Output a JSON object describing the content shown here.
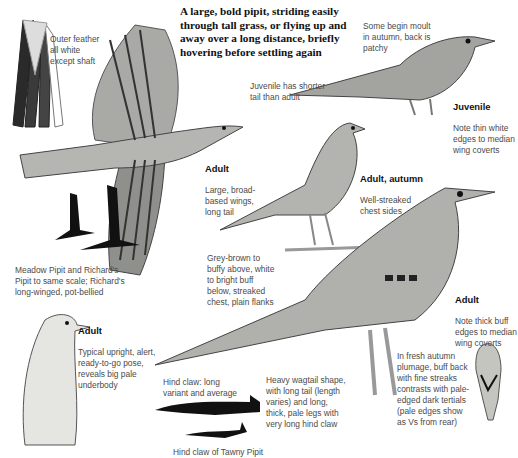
{
  "intro": {
    "text": "A large, bold pipit, striding easily through tall grass, or flying up and away over a long distance, briefly hovering before settling again"
  },
  "annotations": {
    "outer_feather": {
      "title": "",
      "text": "Outer feather\nall white\nexcept shaft"
    },
    "moult": {
      "title": "",
      "text": "Some begin moult\nin autumn, back is\npatchy"
    },
    "juvenile_tail": {
      "title": "",
      "text": "Juvenile has shorter\ntail than adult"
    },
    "juvenile": {
      "title": "Juvenile",
      "text": "Note thin white\nedges to median\nwing coverts"
    },
    "adult_flight": {
      "title": "Adult",
      "text": "Large, broad-\nbased wings,\nlong tail"
    },
    "adult_autumn": {
      "title": "Adult, autumn",
      "text": "Well-streaked\nchest sides"
    },
    "silhouettes": {
      "title": "",
      "text": "Meadow Pipit and Richard's\nPipit to same scale; Richard's\nlong-winged, pot-bellied"
    },
    "plumage": {
      "title": "",
      "text": "Grey-brown to\nbuffy above, white\nto bright buff\nbelow, streaked\nchest, plain flanks"
    },
    "adult_large": {
      "title": "Adult",
      "text": "Note thick buff\nedges to median\nwing coverts"
    },
    "adult_upright": {
      "title": "Adult",
      "text": "Typical upright, alert,\nready-to-go pose,\nreveals big pale\nunderbody"
    },
    "hind_claw": {
      "title": "",
      "text": "Hind claw: long\nvariant and average"
    },
    "shape": {
      "title": "",
      "text": "Heavy wagtail shape,\nwith long tail (length\nvaries) and long,\nthick, pale legs with\nvery long hind claw"
    },
    "autumn_back": {
      "title": "",
      "text": "In fresh autumn\nplumage, buff back\nwith fine streaks\ncontrasts with pale-\nedged dark tertials\n(pale edges show\nas Vs from rear)"
    },
    "tawny_claw": {
      "title": "",
      "text": "Hind claw of Tawny Pipit"
    }
  },
  "illustrations": [
    {
      "name": "outer-tail-feather",
      "label": "outer feather illustration"
    },
    {
      "name": "adult-flight",
      "label": "adult in flight"
    },
    {
      "name": "juvenile-perched",
      "label": "juvenile"
    },
    {
      "name": "adult-autumn-perched",
      "label": "adult autumn"
    },
    {
      "name": "flight-silhouettes",
      "label": "Meadow Pipit and Richard's Pipit silhouettes"
    },
    {
      "name": "adult-large",
      "label": "adult standing"
    },
    {
      "name": "adult-upright",
      "label": "adult upright pose"
    },
    {
      "name": "hind-claw-long",
      "label": "hind claw long"
    },
    {
      "name": "hind-claw-tawny",
      "label": "hind claw tawny pipit"
    },
    {
      "name": "rear-view",
      "label": "adult from rear"
    }
  ],
  "colors": {
    "ink": "#1a1a1a",
    "wash": "#b9b9b6",
    "text": "#4a4a4a"
  }
}
